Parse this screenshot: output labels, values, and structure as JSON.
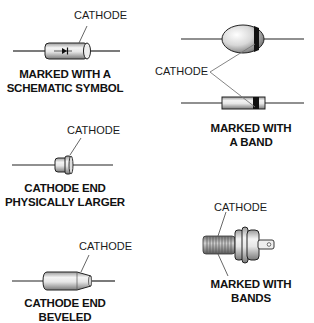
{
  "colors": {
    "ink": "#111111",
    "lead": "#222222",
    "body_light": "#f2f2f2",
    "body_dark": "#8a8a8a",
    "band": "#111111",
    "pointer": "#777777"
  },
  "panels": [
    {
      "id": "schematic-symbol",
      "pointer_label": "CATHODE",
      "caption_line1": "MARKED WITH A",
      "caption_line2": "SCHEMATIC SYMBOL",
      "icon": "diode-schematic-symbol-icon"
    },
    {
      "id": "band",
      "pointer_label": "CATHODE",
      "caption_line1": "MARKED WITH",
      "caption_line2": "A BAND"
    },
    {
      "id": "physically-larger",
      "pointer_label": "CATHODE",
      "caption_line1": "CATHODE END",
      "caption_line2": "PHYSICALLY LARGER"
    },
    {
      "id": "bands-stud",
      "pointer_label": "CATHODE",
      "caption_line1": "MARKED WITH",
      "caption_line2": "BANDS"
    },
    {
      "id": "beveled",
      "pointer_label": "CATHODE",
      "caption_line1": "CATHODE END",
      "caption_line2": "BEVELED"
    }
  ]
}
